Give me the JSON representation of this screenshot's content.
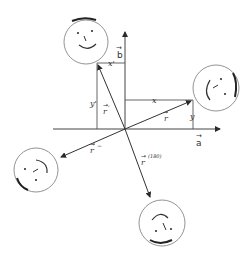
{
  "diagram": {
    "title": "",
    "colors": {
      "line": "#2a2a2a",
      "face": "#555555",
      "text": "#333333",
      "background": "#ffffff"
    },
    "axes": {
      "origin": [
        125,
        129
      ],
      "a_axis": {
        "label": "a",
        "vector_arrow": "→",
        "from": [
          53,
          129
        ],
        "to": [
          222,
          129
        ]
      },
      "b_axis": {
        "label": "b",
        "vector_arrow": "→",
        "from": [
          125,
          129
        ],
        "to": [
          125,
          30
        ]
      }
    },
    "vectors": [
      {
        "name": "r",
        "label": "r",
        "arrow": "→",
        "superscript": "",
        "from": [
          125,
          129
        ],
        "to": [
          193,
          100
        ]
      },
      {
        "name": "r-prime",
        "label": "r",
        "arrow": "→",
        "superscript": "'",
        "from": [
          125,
          129
        ],
        "to": [
          97,
          63
        ]
      },
      {
        "name": "r-minus",
        "label": "r",
        "arrow": "→",
        "superscript": "−",
        "from": [
          125,
          129
        ],
        "to": [
          59,
          158
        ]
      },
      {
        "name": "r-180",
        "label": "r",
        "arrow": "→",
        "superscript": "(180)",
        "from": [
          125,
          129
        ],
        "to": [
          151,
          199
        ]
      }
    ],
    "components": [
      {
        "name": "x",
        "label": "x",
        "from": [
          125,
          100
        ],
        "to": [
          193,
          100
        ]
      },
      {
        "name": "y",
        "label": "y",
        "from": [
          193,
          100
        ],
        "to": [
          193,
          129
        ]
      },
      {
        "name": "x-prime",
        "label": "x'",
        "from": [
          97,
          63
        ],
        "to": [
          125,
          63
        ]
      },
      {
        "name": "y-prime",
        "label": "y'",
        "from": [
          97,
          63
        ],
        "to": [
          97,
          129
        ]
      }
    ],
    "faces": [
      {
        "name": "face-top",
        "center": [
          86,
          42
        ],
        "radius": 22,
        "orientation": "upright"
      },
      {
        "name": "face-right",
        "center": [
          216,
          88
        ],
        "radius": 23,
        "orientation": "rotated"
      },
      {
        "name": "face-left",
        "center": [
          36,
          170
        ],
        "radius": 22,
        "orientation": "rotated"
      },
      {
        "name": "face-bottom",
        "center": [
          162,
          223
        ],
        "radius": 23,
        "orientation": "upside-down"
      }
    ]
  }
}
